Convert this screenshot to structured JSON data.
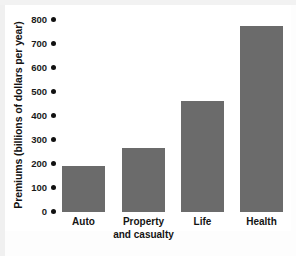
{
  "chart_data": {
    "type": "bar",
    "title": "",
    "xlabel": "",
    "ylabel": "Premiums (billions of dollars per year)",
    "categories": [
      "Auto",
      "Property and casualty",
      "Life",
      "Health"
    ],
    "values": [
      190,
      265,
      462,
      775
    ],
    "ylim": [
      0,
      800
    ],
    "yticks": [
      0,
      100,
      200,
      300,
      400,
      500,
      600,
      700,
      800
    ],
    "ytick_labels": [
      "0",
      "100",
      "200",
      "300",
      "400",
      "500",
      "600",
      "700",
      "800"
    ],
    "grid": false,
    "legend": null,
    "bar_color": "#6b6b6b",
    "axis_color": "#111111",
    "text_color": "#141414",
    "background": "#ffffff"
  },
  "axis": {
    "y_title": "Premiums (billions of dollars per year)",
    "tick_marker": "filled-dot"
  },
  "categories": [
    {
      "label": "Auto",
      "line1": "Auto",
      "line2": ""
    },
    {
      "label": "Property and casualty",
      "line1": "Property",
      "line2": "and casualty"
    },
    {
      "label": "Life",
      "line1": "Life",
      "line2": ""
    },
    {
      "label": "Health",
      "line1": "Health",
      "line2": ""
    }
  ]
}
